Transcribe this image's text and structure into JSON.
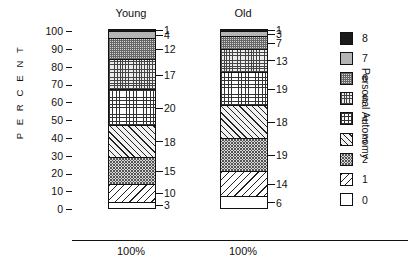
{
  "chart_data": {
    "type": "bar",
    "subtype": "stacked-bar-100pct",
    "title": "",
    "xlabel": "",
    "ylabel": "P E R C E N T",
    "ylim": [
      0,
      100
    ],
    "ytick_values": [
      100,
      90,
      80,
      70,
      60,
      50,
      40,
      30,
      20,
      10,
      0
    ],
    "ytick_labels": [
      "100",
      "90",
      "80",
      "70",
      "60",
      "50",
      "40",
      "30",
      "20",
      "10",
      "0"
    ],
    "grid": false,
    "legend_title": "Personal Autonomy",
    "legend_position": "right",
    "legend_entries": [
      "8",
      "7",
      "6",
      "5",
      "4",
      "3",
      "2",
      "1",
      "0"
    ],
    "categories": [
      "Young",
      "Old"
    ],
    "category_totals": [
      "100%",
      "100%"
    ],
    "series": [
      {
        "name": "0",
        "pattern": "p0",
        "values": [
          3,
          6
        ]
      },
      {
        "name": "1",
        "pattern": "p1",
        "values": [
          10,
          14
        ]
      },
      {
        "name": "2",
        "pattern": "p2",
        "values": [
          15,
          19
        ]
      },
      {
        "name": "3",
        "pattern": "p3",
        "values": [
          18,
          18
        ]
      },
      {
        "name": "4",
        "pattern": "p4",
        "values": [
          20,
          19
        ]
      },
      {
        "name": "5",
        "pattern": "p5",
        "values": [
          17,
          13
        ]
      },
      {
        "name": "6",
        "pattern": "p6",
        "values": [
          12,
          7
        ]
      },
      {
        "name": "7",
        "pattern": "p7",
        "values": [
          4,
          3
        ]
      },
      {
        "name": "8",
        "pattern": "p8",
        "values": [
          1,
          1
        ]
      }
    ],
    "bars": {
      "young": {
        "label": "Young",
        "axis_label": "100%",
        "segments_bottom_to_top": [
          {
            "category": "0",
            "value": 3,
            "label": "3",
            "pattern": "p0"
          },
          {
            "category": "1",
            "value": 10,
            "label": "10",
            "pattern": "p1"
          },
          {
            "category": "2",
            "value": 15,
            "label": "15",
            "pattern": "p2"
          },
          {
            "category": "3",
            "value": 18,
            "label": "18",
            "pattern": "p3"
          },
          {
            "category": "4",
            "value": 20,
            "label": "20",
            "pattern": "p4"
          },
          {
            "category": "5",
            "value": 17,
            "label": "17",
            "pattern": "p5"
          },
          {
            "category": "6",
            "value": 12,
            "label": "12",
            "pattern": "p6"
          },
          {
            "category": "7",
            "value": 4,
            "label": "4",
            "pattern": "p7"
          },
          {
            "category": "8",
            "value": 1,
            "label": "1",
            "pattern": "p8"
          }
        ]
      },
      "old": {
        "label": "Old",
        "axis_label": "100%",
        "segments_bottom_to_top": [
          {
            "category": "0",
            "value": 6,
            "label": "6",
            "pattern": "p0"
          },
          {
            "category": "1",
            "value": 14,
            "label": "14",
            "pattern": "p1"
          },
          {
            "category": "2",
            "value": 19,
            "label": "19",
            "pattern": "p2"
          },
          {
            "category": "3",
            "value": 18,
            "label": "18",
            "pattern": "p3"
          },
          {
            "category": "4",
            "value": 19,
            "label": "19",
            "pattern": "p4"
          },
          {
            "category": "5",
            "value": 13,
            "label": "13",
            "pattern": "p5"
          },
          {
            "category": "6",
            "value": 7,
            "label": "7",
            "pattern": "p6"
          },
          {
            "category": "7",
            "value": 3,
            "label": "3",
            "pattern": "p7"
          },
          {
            "category": "8",
            "value": 1,
            "label": "1",
            "pattern": "p8"
          }
        ]
      }
    },
    "legend_items_top_to_bottom": [
      {
        "label": "8",
        "pattern": "p8"
      },
      {
        "label": "7",
        "pattern": "p7"
      },
      {
        "label": "6",
        "pattern": "p6"
      },
      {
        "label": "5",
        "pattern": "p5"
      },
      {
        "label": "4",
        "pattern": "p4"
      },
      {
        "label": "3",
        "pattern": "p3"
      },
      {
        "label": "2",
        "pattern": "p2"
      },
      {
        "label": "1",
        "pattern": "p1"
      },
      {
        "label": "0",
        "pattern": "p0"
      }
    ],
    "colors": {
      "ink": "#1a1a1a",
      "background": "#ffffff",
      "solid_grey": "#b4b4b4",
      "solid_black": "#1a1a1a"
    }
  }
}
